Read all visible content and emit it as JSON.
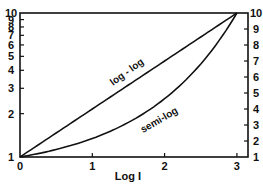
{
  "chart_data": {
    "type": "line",
    "title": "",
    "xlabel": "Log I",
    "ylabel_left": "",
    "ylabel_right": "",
    "xlim": [
      0,
      3
    ],
    "x_ticks": [
      "0",
      "1",
      "2",
      "3"
    ],
    "left_axis": {
      "scale": "log",
      "range": [
        1,
        10
      ],
      "ticks": [
        "1",
        "2",
        "3",
        "4",
        "5",
        "6",
        "7",
        "8",
        "9",
        "10"
      ]
    },
    "right_axis": {
      "scale": "linear",
      "range": [
        1,
        10
      ],
      "ticks": [
        "1",
        "2",
        "3",
        "4",
        "5",
        "6",
        "7",
        "8",
        "9",
        "10"
      ]
    },
    "grid": false,
    "legend": "none",
    "series": [
      {
        "name": "log - log",
        "axis": "left",
        "x": [
          0,
          0.5,
          1,
          1.5,
          2,
          2.5,
          3
        ],
        "values": [
          1,
          1.47,
          2.15,
          3.16,
          4.64,
          6.81,
          10
        ]
      },
      {
        "name": "semi-log",
        "axis": "right",
        "x": [
          0,
          0.5,
          1,
          1.5,
          2,
          2.5,
          3
        ],
        "values": [
          1,
          1.47,
          2.15,
          3.16,
          4.64,
          6.81,
          10
        ]
      }
    ],
    "annotations": [
      "log - log",
      "semi-log"
    ]
  },
  "labels": {
    "x_axis_title": "Log I",
    "curve_loglog": "log - log",
    "curve_semilog": "semi-log"
  }
}
